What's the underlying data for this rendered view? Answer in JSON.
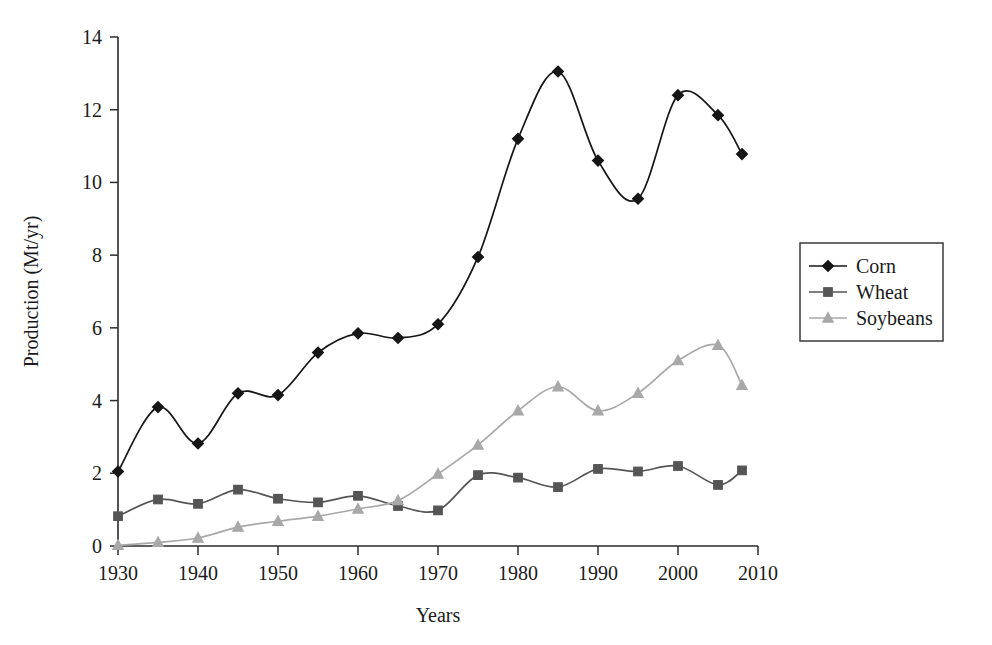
{
  "chart_data": {
    "type": "line",
    "title": "",
    "xlabel": "Years",
    "ylabel": "Production (Mt/yr)",
    "xlim": [
      1930,
      2010
    ],
    "ylim": [
      0,
      14
    ],
    "xticks": [
      1930,
      1940,
      1950,
      1960,
      1970,
      1980,
      1990,
      2000,
      2010
    ],
    "yticks": [
      0,
      2,
      4,
      6,
      8,
      10,
      12,
      14
    ],
    "xtick_labels": [
      "1930",
      "1940",
      "1950",
      "1960",
      "1970",
      "1980",
      "1990",
      "2000",
      "2010"
    ],
    "ytick_labels": [
      "0",
      "2",
      "4",
      "6",
      "8",
      "10",
      "12",
      "14"
    ],
    "grid": false,
    "legend_position": "right",
    "smoothing": "spline",
    "x": [
      1930,
      1935,
      1940,
      1945,
      1950,
      1955,
      1960,
      1965,
      1970,
      1975,
      1980,
      1985,
      1990,
      1995,
      2000,
      2005,
      2008
    ],
    "series": [
      {
        "name": "Corn",
        "marker": "diamond",
        "color": "#161616",
        "values": [
          2.05,
          3.82,
          2.82,
          4.2,
          4.15,
          5.32,
          5.85,
          5.72,
          6.1,
          7.95,
          11.2,
          13.05,
          10.6,
          9.55,
          12.4,
          11.85,
          10.78
        ]
      },
      {
        "name": "Wheat",
        "marker": "square",
        "color": "#555555",
        "values": [
          0.82,
          1.28,
          1.16,
          1.55,
          1.3,
          1.2,
          1.38,
          1.1,
          0.98,
          1.95,
          1.88,
          1.62,
          2.12,
          2.05,
          2.2,
          1.68,
          2.08
        ]
      },
      {
        "name": "Soybeans",
        "marker": "triangle",
        "color": "#a8a8a8",
        "values": [
          0.02,
          0.1,
          0.22,
          0.52,
          0.68,
          0.82,
          1.02,
          1.25,
          1.98,
          2.78,
          3.72,
          4.38,
          3.72,
          4.2,
          5.1,
          5.52,
          4.42
        ]
      }
    ]
  },
  "legend": {
    "items": [
      {
        "label": "Corn"
      },
      {
        "label": "Wheat"
      },
      {
        "label": "Soybeans"
      }
    ]
  }
}
